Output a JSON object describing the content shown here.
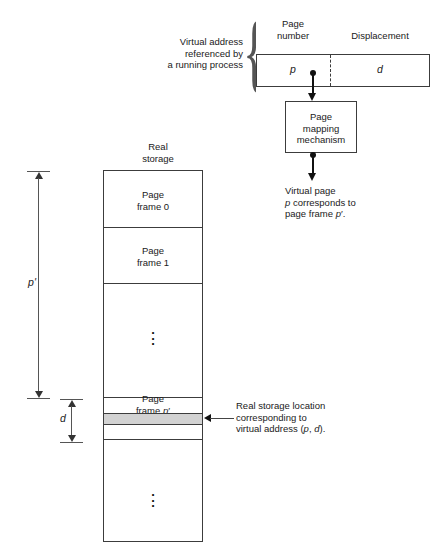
{
  "diagram": {
    "virtual_address": {
      "side_label": "Virtual address\nreferenced by\na running process",
      "brace_glyph": "{",
      "field_headers": {
        "page_number": "Page\nnumber",
        "displacement": "Displacement"
      },
      "field_values": {
        "page_number": "p",
        "displacement": "d"
      }
    },
    "mapping_box": {
      "label": "Page\nmapping\nmechanism"
    },
    "mapping_result": {
      "text": "Virtual page\np corresponds to\npage frame p'."
    },
    "real_storage": {
      "title": "Real\nstorage",
      "frames": [
        {
          "label": "Page\nframe 0"
        },
        {
          "label": "Page\nframe 1"
        },
        {
          "label": "⋮"
        },
        {
          "label": "Page\nframe p'"
        },
        {
          "label": "⋮"
        }
      ],
      "highlight_band": {
        "color": "#d2d2d2",
        "callout": "Real storage location\ncorresponding to\nvirtual address (p, d)."
      }
    },
    "dimensions": [
      {
        "name": "p-prime-offset",
        "label": "p'"
      },
      {
        "name": "d-offset",
        "label": "d"
      }
    ],
    "colors": {
      "line": "#3c3c3c",
      "text": "#1a1a1a",
      "highlight": "#d2d2d2",
      "background": "#ffffff"
    }
  }
}
